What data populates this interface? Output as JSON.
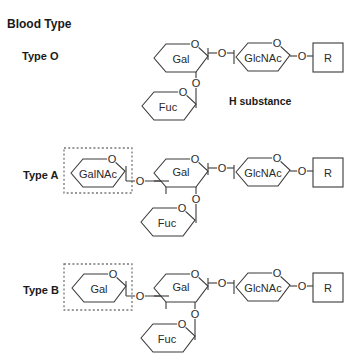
{
  "title": "Blood Type",
  "symbols": {
    "oxygen": "O"
  },
  "types": [
    {
      "label": "Type O",
      "annotation": "H substance",
      "residues": {
        "gal": "Gal",
        "glcnac": "GlcNAc",
        "fuc": "Fuc",
        "aglycone": "R"
      }
    },
    {
      "label": "Type A",
      "terminal": "GalNAc",
      "residues": {
        "gal": "Gal",
        "glcnac": "GlcNAc",
        "fuc": "Fuc",
        "aglycone": "R"
      }
    },
    {
      "label": "Type B",
      "terminal": "Gal",
      "residues": {
        "gal": "Gal",
        "glcnac": "GlcNAc",
        "fuc": "Fuc",
        "aglycone": "R"
      }
    }
  ],
  "colors": {
    "line": "#3a3a3a",
    "text": "#1a1a1a",
    "dashed_box": "#777777"
  }
}
